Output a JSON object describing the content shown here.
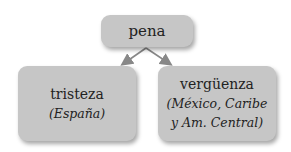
{
  "diagram": {
    "root": {
      "label": "pena"
    },
    "children": [
      {
        "term": "tristeza",
        "region_lines": [
          "(España)"
        ]
      },
      {
        "term": "vergüenza",
        "region_lines": [
          "(México, Caribe",
          "y Am. Central)"
        ]
      }
    ],
    "colors": {
      "box_fill": "#c6c6c6",
      "text": "#222222",
      "arrow": "#888888"
    }
  }
}
